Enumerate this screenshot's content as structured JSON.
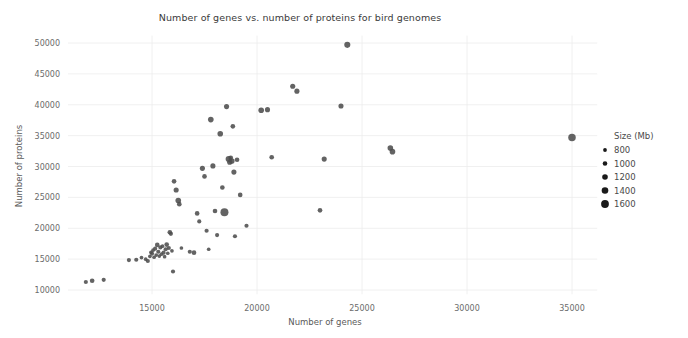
{
  "chart_data": {
    "type": "scatter",
    "title": "Number of genes vs. number of proteins for bird genomes",
    "xlabel": "Number of genes",
    "ylabel": "Number of proteins",
    "xlim": [
      11000,
      36200
    ],
    "ylim": [
      9300,
      51200
    ],
    "xticks": [
      15000,
      20000,
      25000,
      30000,
      35000
    ],
    "xtick_labels": [
      "15000",
      "20000",
      "25000",
      "30000",
      "35000"
    ],
    "yticks": [
      10000,
      15000,
      20000,
      25000,
      30000,
      35000,
      40000,
      45000,
      50000
    ],
    "ytick_labels": [
      "10000",
      "15000",
      "20000",
      "25000",
      "30000",
      "35000",
      "40000",
      "45000",
      "50000"
    ],
    "grid": true,
    "size_encoding": "Size (Mb)",
    "marker_color": "#4d4d4d",
    "legend": {
      "title": "Size (Mb)",
      "position": "right",
      "entries": [
        {
          "label": "800",
          "value": 800,
          "radius": 1.9
        },
        {
          "label": "1000",
          "value": 1000,
          "radius": 2.3
        },
        {
          "label": "1200",
          "value": 1200,
          "radius": 2.8
        },
        {
          "label": "1400",
          "value": 1400,
          "radius": 3.3
        },
        {
          "label": "1600",
          "value": 1600,
          "radius": 3.9
        }
      ]
    },
    "points": [
      {
        "x": 11850,
        "y": 11300,
        "size": 1050
      },
      {
        "x": 12150,
        "y": 11500,
        "size": 1100
      },
      {
        "x": 12700,
        "y": 11650,
        "size": 1050
      },
      {
        "x": 13900,
        "y": 14850,
        "size": 1050
      },
      {
        "x": 14250,
        "y": 14900,
        "size": 1050
      },
      {
        "x": 14500,
        "y": 15250,
        "size": 1000
      },
      {
        "x": 14700,
        "y": 15000,
        "size": 1000
      },
      {
        "x": 14800,
        "y": 14700,
        "size": 1050
      },
      {
        "x": 14900,
        "y": 15450,
        "size": 1000
      },
      {
        "x": 14950,
        "y": 16100,
        "size": 1000
      },
      {
        "x": 15000,
        "y": 15900,
        "size": 1050
      },
      {
        "x": 15050,
        "y": 16450,
        "size": 1000
      },
      {
        "x": 15100,
        "y": 15300,
        "size": 1000
      },
      {
        "x": 15150,
        "y": 16700,
        "size": 1050
      },
      {
        "x": 15200,
        "y": 15650,
        "size": 1000
      },
      {
        "x": 15250,
        "y": 17300,
        "size": 1100
      },
      {
        "x": 15300,
        "y": 16200,
        "size": 1050
      },
      {
        "x": 15350,
        "y": 15500,
        "size": 1000
      },
      {
        "x": 15400,
        "y": 16900,
        "size": 1050
      },
      {
        "x": 15450,
        "y": 15800,
        "size": 1000
      },
      {
        "x": 15500,
        "y": 17100,
        "size": 1000
      },
      {
        "x": 15550,
        "y": 16050,
        "size": 1050
      },
      {
        "x": 15600,
        "y": 15400,
        "size": 1000
      },
      {
        "x": 15650,
        "y": 16600,
        "size": 1050
      },
      {
        "x": 15700,
        "y": 17350,
        "size": 1100
      },
      {
        "x": 15750,
        "y": 15950,
        "size": 1000
      },
      {
        "x": 15800,
        "y": 16800,
        "size": 1050
      },
      {
        "x": 15850,
        "y": 19350,
        "size": 1100
      },
      {
        "x": 15900,
        "y": 19100,
        "size": 1050
      },
      {
        "x": 15950,
        "y": 16350,
        "size": 1000
      },
      {
        "x": 16000,
        "y": 13000,
        "size": 1050
      },
      {
        "x": 16050,
        "y": 27600,
        "size": 1100
      },
      {
        "x": 16150,
        "y": 26200,
        "size": 1150
      },
      {
        "x": 16250,
        "y": 24500,
        "size": 1200
      },
      {
        "x": 16300,
        "y": 23900,
        "size": 1100
      },
      {
        "x": 16400,
        "y": 16800,
        "size": 1000
      },
      {
        "x": 16800,
        "y": 16200,
        "size": 1050
      },
      {
        "x": 17000,
        "y": 16050,
        "size": 1100
      },
      {
        "x": 17150,
        "y": 22400,
        "size": 1100
      },
      {
        "x": 17250,
        "y": 21100,
        "size": 1050
      },
      {
        "x": 17400,
        "y": 29700,
        "size": 1150
      },
      {
        "x": 17500,
        "y": 28400,
        "size": 1100
      },
      {
        "x": 17600,
        "y": 19600,
        "size": 1050
      },
      {
        "x": 17700,
        "y": 16600,
        "size": 1000
      },
      {
        "x": 17800,
        "y": 37600,
        "size": 1200
      },
      {
        "x": 17900,
        "y": 30100,
        "size": 1150
      },
      {
        "x": 18000,
        "y": 22800,
        "size": 1100
      },
      {
        "x": 18100,
        "y": 18900,
        "size": 1050
      },
      {
        "x": 18250,
        "y": 35300,
        "size": 1200
      },
      {
        "x": 18350,
        "y": 26600,
        "size": 1100
      },
      {
        "x": 18450,
        "y": 22600,
        "size": 1450
      },
      {
        "x": 18550,
        "y": 39700,
        "size": 1150
      },
      {
        "x": 18650,
        "y": 31200,
        "size": 1250
      },
      {
        "x": 18700,
        "y": 30700,
        "size": 1150
      },
      {
        "x": 18750,
        "y": 31400,
        "size": 1100
      },
      {
        "x": 18800,
        "y": 30900,
        "size": 1200
      },
      {
        "x": 18850,
        "y": 36500,
        "size": 1100
      },
      {
        "x": 18900,
        "y": 29100,
        "size": 1150
      },
      {
        "x": 18950,
        "y": 18700,
        "size": 1050
      },
      {
        "x": 19050,
        "y": 31100,
        "size": 1100
      },
      {
        "x": 19200,
        "y": 25400,
        "size": 1100
      },
      {
        "x": 19500,
        "y": 20400,
        "size": 1050
      },
      {
        "x": 20200,
        "y": 39100,
        "size": 1200
      },
      {
        "x": 20500,
        "y": 39200,
        "size": 1150
      },
      {
        "x": 20700,
        "y": 31500,
        "size": 1100
      },
      {
        "x": 21700,
        "y": 43000,
        "size": 1150
      },
      {
        "x": 21900,
        "y": 42200,
        "size": 1150
      },
      {
        "x": 23000,
        "y": 22900,
        "size": 1100
      },
      {
        "x": 23200,
        "y": 31200,
        "size": 1150
      },
      {
        "x": 24000,
        "y": 39800,
        "size": 1150
      },
      {
        "x": 24300,
        "y": 49700,
        "size": 1250
      },
      {
        "x": 26350,
        "y": 33000,
        "size": 1200
      },
      {
        "x": 26450,
        "y": 32400,
        "size": 1200
      },
      {
        "x": 35000,
        "y": 34700,
        "size": 1400
      }
    ]
  }
}
